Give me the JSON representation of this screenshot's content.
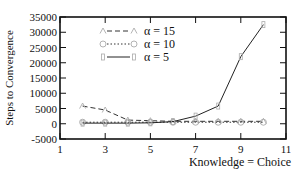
{
  "chart_data": {
    "type": "line",
    "title": "",
    "xlabel": "Knowledge = Choice",
    "ylabel": "Steps to Convergence",
    "xlim": [
      1,
      11
    ],
    "ylim": [
      -5000,
      35000
    ],
    "x_ticks": [
      1,
      3,
      5,
      7,
      9,
      11
    ],
    "y_ticks": [
      -5000,
      0,
      5000,
      10000,
      15000,
      20000,
      25000,
      30000,
      35000
    ],
    "grid": false,
    "legend_position": "upper-left",
    "x": [
      2,
      3,
      4,
      5,
      6,
      7,
      8,
      9,
      10
    ],
    "series": [
      {
        "name": "α = 15",
        "style": "dashed",
        "marker": "triangle",
        "color": "#333333",
        "values": [
          5800,
          4500,
          1200,
          1000,
          800,
          800,
          800,
          800,
          800
        ]
      },
      {
        "name": "α = 10",
        "style": "dotted",
        "marker": "circle",
        "color": "#333333",
        "values": [
          500,
          500,
          500,
          500,
          500,
          500,
          500,
          500,
          500
        ]
      },
      {
        "name": "α = 5",
        "style": "solid",
        "marker": "square",
        "color": "#222222",
        "values": [
          200,
          200,
          200,
          300,
          700,
          2500,
          5800,
          22000,
          32500
        ]
      }
    ]
  }
}
